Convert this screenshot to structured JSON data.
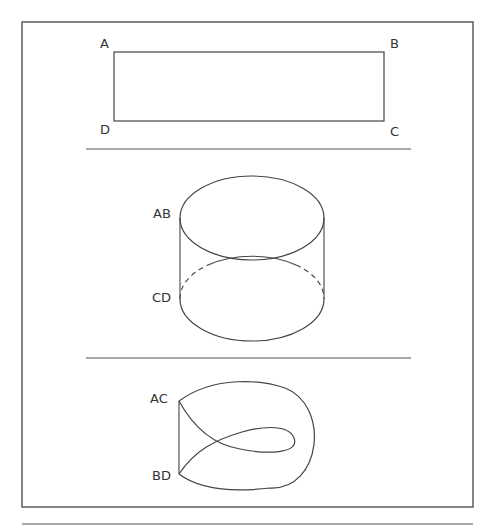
{
  "figure": {
    "panels": [
      {
        "name": "rectangle",
        "labels": {
          "top_left": "A",
          "top_right": "B",
          "bottom_left": "D",
          "bottom_right": "C"
        }
      },
      {
        "name": "cylinder",
        "labels": {
          "top": "AB",
          "bottom": "CD"
        }
      },
      {
        "name": "twisted-surface",
        "labels": {
          "top": "AC",
          "bottom": "BD"
        }
      }
    ],
    "colors": {
      "stroke": "#444444",
      "background": "#ffffff"
    }
  }
}
